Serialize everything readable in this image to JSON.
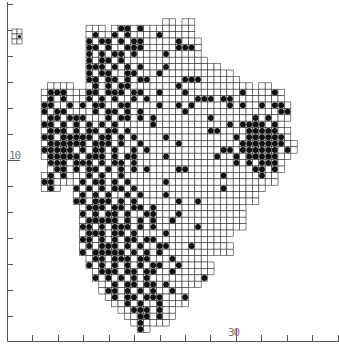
{
  "map": {
    "title": "",
    "type": "tetrad distribution map",
    "region": "Devon",
    "axis": {
      "y_label_major": "10",
      "x_label_major": "30",
      "y_ticks": [
        4,
        30,
        56,
        82,
        108,
        134,
        160,
        186,
        212,
        238,
        264,
        290,
        316
      ],
      "x_ticks": [
        32,
        58,
        83,
        109,
        134,
        160,
        185,
        210,
        236,
        261,
        287,
        312,
        338
      ],
      "y_major_tick": 160,
      "x_major_tick": 236,
      "color": "#555555"
    },
    "grid": {
      "origin_x": 22,
      "origin_y": 6,
      "cell": 6.4,
      "line_color": "#333333",
      "dot_color": "#111111",
      "rows": [
        ".............................................",
        ".............................................",
        "......................oo.oo..................",
        "..........ooo.o##o#oooooooo..................",
        "..........o#oo#o#oooo#ooooo..................",
        "..........#o##o#o##ooooo#ooo.................",
        "..........##o#oo###ooooo###o.................",
        "..........#o#o##o#oooo#ooooo.................",
        "..........#o##o#ooooooooooooo................",
        "..........###o#o#o#ooo#oooooooo..............",
        "..........#o##oo##ooo#ooooooooooo............",
        "..........##o##o#o##ooooo###oooooo...........",
        "....oooo..o#o#o##ooooooo#ooooooooooo.oo......",
        "...o###ooo##o###o##oo#ooo#oooooooo#oooo#o....",
        "...o#o#ooo#o#o#oo#o#ooooooo###o##oooooooo....",
        "...##oo#o#o##oo##oooo#oo#o#ooooo#o#oo#o##o...",
        "...#o##oooo#o##o#o#oooooo#oooooooooooooo##...",
        "...o##o###ooo#o##o#o#oooooooo#oooooo#o#ooo...",
        "...##o#o#o#o#o#ooooo#ooooooooooo#o####o#o....",
        "...o###o#o##o##o#oooooooooooo##oooo#####oo...",
        "...##o#####o##o#o#oooo#oooooooooo#o######o...",
        "...o######o###o#oo#ooooo#ooooooooo#######oo..",
        "...#####o#o##o#oo#o#ooooooooooo##o######o#o..",
        "...o#####o###o#o##oooo#ooooooo#oo#o#####oo...",
        "....###o###o#o##o#ooooooooooooooo#o#o###o....",
        "....o##o#o##o#o#o#o#oooo##oooooooooo##o#o....",
        "...o#o#ooo#o#oo#ooooooooooooooo#ooooo#oo.....",
        "...##oooo#o##o#o#ooooo#ooooooooooooooooo.....",
        "...o#o..#o#o#o##o#ooooooooooooo#oooooo.......",
        "........o#o#o#oo#o#ooo#oooooooooooooo........",
        "........##o###o#o#oooooo#oo#ooooooooo........",
        ".........o###o##o##o#oooooooooooooo..........",
        ".........#o#o##o#oo##ooo#oooooooooo..........",
        ".........o#####o#o#o#oo#ooooooooooo..........",
        ".........##o#o###o#o#oooooo#ooooooo..........",
        ".........o###o##o#oooo#oooooooooo............",
        ".........##o#o#o##o##ooooooooooo.............",
        ".........o#o###o#o#oo##ooo#oooooo............",
        ".........#o#####o#o#o#ooooooooooo............",
        "..........o##o###o##ooo#ooooo................",
        "..........#o#o#o#o#o##oo#ooooo...............",
        "...........o###o##o##oo#oooooo...............",
        "...........#o#o#o#o#oooooooo#................",
        "............oo#o##o##o#ooooo.................",
        "............o##o#o#o#oo#oo...................",
        ".............o#o##o###ooo#...................",
        "..............oo#o#oo#oooo...................",
        "...............oo###o#oo.....................",
        "................oo##o#oo.....................",
        ".................o#oooo......................",
        "..................#o.........................",
        "............................................."
      ]
    },
    "inset": {
      "x": 12,
      "y": 29,
      "cols": 2,
      "rows": 3,
      "cell": 5
    }
  }
}
